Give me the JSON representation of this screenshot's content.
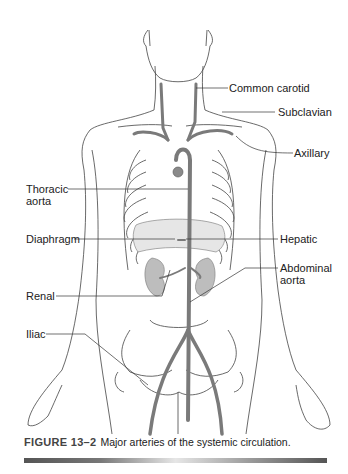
{
  "figure": {
    "labels": {
      "common_carotid": "Common carotid",
      "subclavian": "Subclavian",
      "axillary": "Axillary",
      "thoracic_aorta_line1": "Thoracic",
      "thoracic_aorta_line2": "aorta",
      "diaphragm": "Diaphragm",
      "hepatic": "Hepatic",
      "abdominal_aorta_line1": "Abdominal",
      "abdominal_aorta_line2": "aorta",
      "renal": "Renal",
      "iliac": "Iliac"
    },
    "caption": {
      "figure_number": "FIGURE 13–2",
      "text": "Major arteries of the systemic circulation."
    },
    "colors": {
      "artery": "#7a7a7a",
      "outline": "#444444",
      "organ": "#bdbdbd",
      "leader_line": "#333333"
    }
  }
}
